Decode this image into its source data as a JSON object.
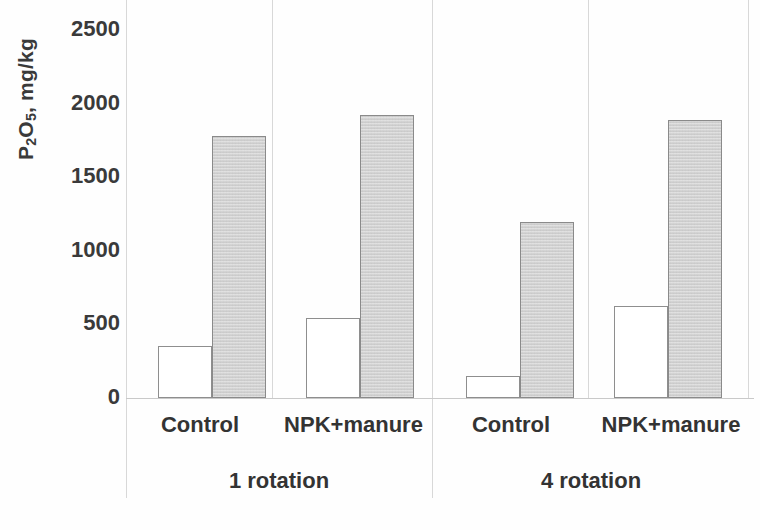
{
  "chart_data": {
    "type": "bar",
    "title": "",
    "xlabel": "",
    "ylabel": "P2O5, mg/kg",
    "ylabel_rich": {
      "prefix": "P",
      "sub1": "2",
      "mid": "O",
      "sub2": "5",
      "suffix": ", mg/kg"
    },
    "ylim": [
      0,
      2500
    ],
    "ytick_values": [
      2500,
      2000,
      1500,
      1000,
      500,
      0
    ],
    "ytick_labels": [
      "2500",
      "2000",
      "1500",
      "1000",
      "500",
      "0"
    ],
    "grid": false,
    "legend": "none",
    "groups": [
      {
        "name": "1 rotation",
        "categories": [
          "Control",
          "NPK+manure"
        ],
        "bars": [
          {
            "category": "Control",
            "series": "white",
            "value": 350
          },
          {
            "category": "Control",
            "series": "gray",
            "value": 1775
          },
          {
            "category": "NPK+manure",
            "series": "white",
            "value": 545
          },
          {
            "category": "NPK+manure",
            "series": "gray",
            "value": 1920
          }
        ]
      },
      {
        "name": "4 rotation",
        "categories": [
          "Control",
          "NPK+manure"
        ],
        "bars": [
          {
            "category": "Control",
            "series": "white",
            "value": 150
          },
          {
            "category": "Control",
            "series": "gray",
            "value": 1190
          },
          {
            "category": "NPK+manure",
            "series": "white",
            "value": 620
          },
          {
            "category": "NPK+manure",
            "series": "gray",
            "value": 1885
          }
        ]
      }
    ],
    "categories": [
      "Control",
      "NPK+manure",
      "Control",
      "NPK+manure"
    ],
    "series": [
      {
        "name": "white",
        "color": "#ffffff",
        "values": [
          350,
          545,
          150,
          620
        ]
      },
      {
        "name": "gray",
        "color": "#d2d2d2",
        "values": [
          1775,
          1920,
          1190,
          1885
        ]
      }
    ],
    "colors": {
      "white_bar_fill": "#ffffff",
      "gray_bar_fill": "#d2d2d2",
      "bar_stroke": "#8a8a8a",
      "text": "#333333",
      "separator": "#d8d8d8"
    }
  },
  "axis": {
    "y_title": "P2O5, mg/kg",
    "ticks": [
      "2500",
      "2000",
      "1500",
      "1000",
      "500",
      "0"
    ]
  },
  "x_labels": {
    "cat0": "Control",
    "cat1": "NPK+manure",
    "cat2": "Control",
    "cat3": "NPK+manure",
    "group0": "1 rotation",
    "group1": "4 rotation"
  }
}
